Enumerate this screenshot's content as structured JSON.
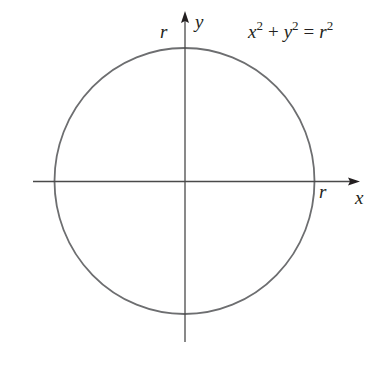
{
  "diagram": {
    "equation": {
      "lhs_var1": "x",
      "lhs_exp1": "2",
      "plus": "+",
      "lhs_var2": "y",
      "lhs_exp2": "2",
      "equals": "=",
      "rhs_var": "r",
      "rhs_exp": "2"
    },
    "axes": {
      "x_label": "x",
      "y_label": "y"
    },
    "radius_labels": {
      "top": "r",
      "right": "r"
    },
    "colors": {
      "axis": "#4a4a4a",
      "circle": "#6d6e70",
      "text": "#231f20"
    },
    "geometry": {
      "center": [
        185,
        181
      ],
      "rx": 130,
      "ry": 133
    }
  }
}
